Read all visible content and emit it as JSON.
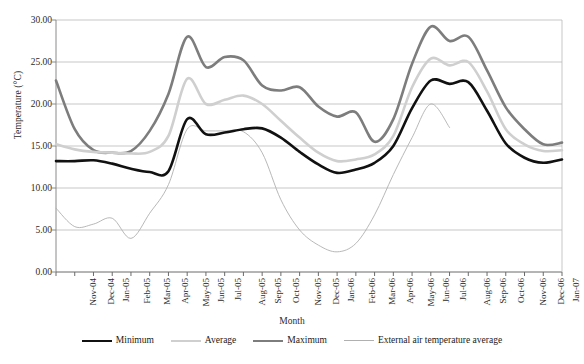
{
  "chart_data": {
    "type": "line",
    "title": "",
    "xlabel": "Month",
    "ylabel": "Temperature (°C)",
    "ylim": [
      0,
      30
    ],
    "ytick_step": 5,
    "ytick_labels": [
      "0.00",
      "5.00",
      "10.00",
      "15.00",
      "20.00",
      "25.00",
      "30.00"
    ],
    "ytick_values": [
      0,
      5,
      10,
      15,
      20,
      25,
      30
    ],
    "grid": "horizontal",
    "legend_position": "bottom",
    "categories": [
      "Nov-04",
      "Dec-04",
      "Jan-05",
      "Feb-05",
      "Mar-05",
      "Apr-05",
      "May-05",
      "Jun-05",
      "Jul-05",
      "Aug-05",
      "Sep-05",
      "Oct-05",
      "Nov-05",
      "Dec-05",
      "Jan-06",
      "Feb-06",
      "Mar-06",
      "Apr-06",
      "May-06",
      "Jun-06",
      "Jul-06",
      "Aug-06",
      "Sep-06",
      "Oct-06",
      "Nov-06",
      "Dec-06",
      "Jan-07",
      "Feb-07"
    ],
    "series": [
      {
        "name": "Minimum",
        "color": "#111111",
        "width": 2.6,
        "values": [
          13.2,
          13.2,
          13.3,
          12.9,
          12.3,
          11.9,
          12.0,
          18.2,
          16.4,
          16.6,
          17.0,
          17.1,
          16.0,
          14.3,
          12.8,
          11.8,
          12.2,
          13.0,
          15.0,
          19.5,
          22.8,
          22.4,
          22.6,
          19.2,
          15.3,
          13.6,
          13.0,
          13.4
        ]
      },
      {
        "name": "Average",
        "color": "#cfcfcf",
        "width": 2.6,
        "values": [
          15.2,
          14.6,
          14.3,
          14.2,
          14.1,
          14.3,
          16.2,
          23.0,
          20.0,
          20.5,
          21.0,
          20.0,
          18.0,
          16.0,
          14.2,
          13.2,
          13.4,
          14.0,
          16.2,
          22.0,
          25.4,
          24.6,
          25.0,
          21.5,
          17.0,
          15.2,
          14.4,
          14.5
        ]
      },
      {
        "name": "Maximum",
        "color": "#7d7d7d",
        "width": 2.6,
        "values": [
          22.8,
          17.0,
          14.5,
          14.2,
          14.4,
          16.8,
          21.2,
          28.0,
          24.4,
          25.6,
          25.2,
          22.2,
          21.6,
          22.0,
          19.7,
          18.5,
          19.0,
          15.5,
          18.2,
          24.8,
          29.2,
          27.5,
          28.0,
          24.0,
          19.6,
          17.0,
          15.2,
          15.4
        ]
      },
      {
        "name": "External air temperature average",
        "color": "#b0b0b0",
        "width": 0.9,
        "values": [
          7.6,
          5.4,
          5.7,
          6.4,
          4.0,
          7.0,
          10.4,
          17.0,
          16.8,
          16.8,
          16.7,
          14.2,
          8.6,
          5.0,
          3.2,
          2.4,
          3.4,
          6.8,
          11.6,
          16.0,
          20.0,
          17.2,
          null,
          null,
          null,
          null,
          null,
          null
        ]
      }
    ]
  },
  "legend": {
    "items": [
      {
        "label": "Minimum"
      },
      {
        "label": "Average"
      },
      {
        "label": "Maximum"
      },
      {
        "label": "External air temperature average"
      }
    ]
  }
}
